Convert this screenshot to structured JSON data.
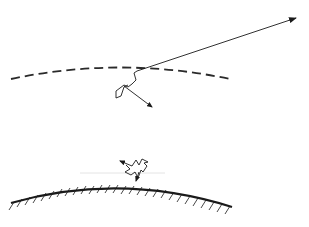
{
  "diagram": {
    "width": 309,
    "height": 227,
    "colors": {
      "background": "#ffffff",
      "stroke": "#1a1a1a",
      "dashed": "#2a2a2a"
    },
    "elements": [
      {
        "id": "atmosphere-boundary",
        "type": "dashed-arc",
        "description": "dashed curved boundary line"
      },
      {
        "id": "outgoing-track",
        "type": "arrow",
        "description": "long straight arrow leaving toward upper right"
      },
      {
        "id": "random-walk-path",
        "type": "zigzag-path",
        "description": "zigzag scattering path below boundary"
      },
      {
        "id": "incoming-track",
        "type": "arrow",
        "description": "short arrow pointing down-right from walk"
      },
      {
        "id": "ground-surface",
        "type": "hatched-arc",
        "description": "solid curved surface with hatching beneath"
      },
      {
        "id": "surface-scatter-symbol",
        "type": "zigzag-path",
        "description": "small scattering glyph above ground with arrows"
      }
    ]
  }
}
